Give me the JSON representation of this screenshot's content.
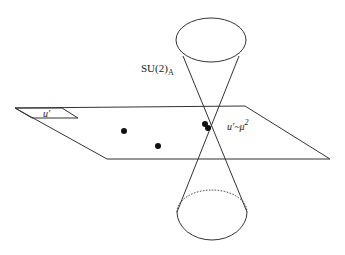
{
  "diagram": {
    "labels": {
      "su2": "SU(2)",
      "su2_sub": "A",
      "u_prime_region": "u'",
      "u_prime_mu": "u'~μ",
      "u_prime_mu_sup": "2"
    },
    "elements": {
      "plane": "moduli plane (parallelogram)",
      "cone": "double cone crossing plane",
      "points": 4
    },
    "colors": {
      "stroke": "#333333",
      "dot": "#111111",
      "background": "#ffffff"
    }
  }
}
